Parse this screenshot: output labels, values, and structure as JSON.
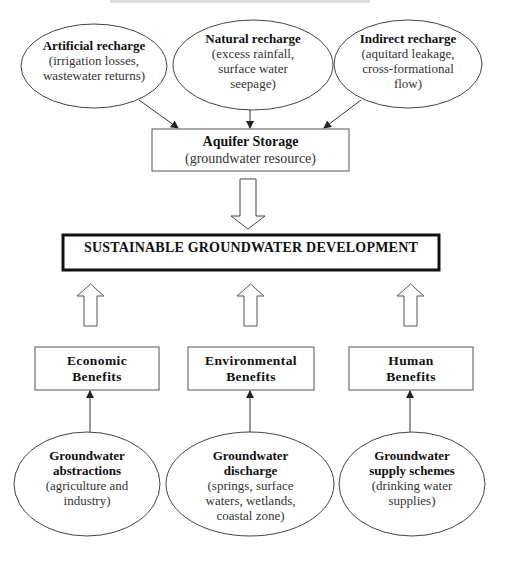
{
  "diagram": {
    "colors": {
      "line": "#333333",
      "background": "#ffffff",
      "text": "#111111"
    },
    "recharge_sources": [
      {
        "title": "Artificial recharge",
        "lines": [
          "(irrigation losses,",
          "wastewater returns)"
        ]
      },
      {
        "title": "Natural recharge",
        "lines": [
          "(excess rainfall,",
          "surface water",
          "seepage)"
        ]
      },
      {
        "title": "Indirect recharge",
        "lines": [
          "(aquitard leakage,",
          "cross-formational",
          "flow)"
        ]
      }
    ],
    "aquifer": {
      "title": "Aquifer Storage",
      "subtitle": "(groundwater resource)"
    },
    "goal": {
      "title": "SUSTAINABLE GROUNDWATER DEVELOPMENT"
    },
    "benefits": [
      {
        "line1": "Economic",
        "line2": "Benefits"
      },
      {
        "line1": "Environmental",
        "line2": "Benefits"
      },
      {
        "line1": "Human",
        "line2": "Benefits"
      }
    ],
    "uses": [
      {
        "title_lines": [
          "Groundwater",
          "abstractions"
        ],
        "desc_lines": [
          "(agriculture and",
          "industry)"
        ]
      },
      {
        "title_lines": [
          "Groundwater",
          "discharge"
        ],
        "desc_lines": [
          "(springs, surface",
          "waters, wetlands,",
          "coastal zone)"
        ]
      },
      {
        "title_lines": [
          "Groundwater",
          "supply schemes"
        ],
        "desc_lines": [
          "(drinking water",
          "supplies)"
        ]
      }
    ]
  }
}
